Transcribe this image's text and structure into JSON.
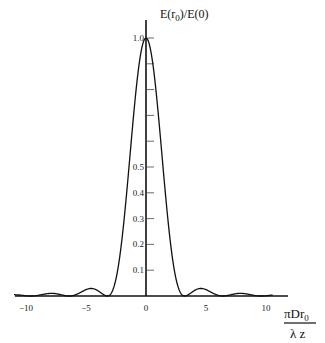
{
  "chart_data": {
    "type": "line",
    "title": "",
    "ylabel": "E(r0)/E(0)",
    "ylabel_parts": {
      "main": "E(r",
      "sub": "0",
      "rest": ")/E(0)"
    },
    "xlabel": "πDr0 / λz",
    "xlabel_parts": {
      "numerator": "πDr",
      "numerator_sub": "0",
      "denominator": "λ z"
    },
    "xlim": [
      -11,
      11.8
    ],
    "ylim": [
      0,
      1.07
    ],
    "grid": false,
    "legend": null,
    "x_ticks": [
      -10,
      -5,
      0,
      5,
      10
    ],
    "x_tick_labels": [
      "−10",
      "−5",
      "0",
      "5",
      "10"
    ],
    "y_ticks": [
      0.1,
      0.2,
      0.3,
      0.4,
      0.5,
      0.6,
      0.7,
      0.8,
      0.9,
      1.0
    ],
    "y_tick_labels": [
      "0.1",
      "0.2",
      "0.3",
      "0.4",
      "0.5",
      "",
      "",
      "",
      "",
      "1.0"
    ],
    "series": [
      {
        "name": "E(r0)/E(0)",
        "x": [
          -11,
          -10.5,
          -9.6,
          -9,
          -8.5,
          -8,
          -7.5,
          -7,
          -6.4,
          -6,
          -5.5,
          -5,
          -4.5,
          -4,
          -3.5,
          -3.2,
          -3,
          -2.5,
          -2,
          -1.5,
          -1,
          -0.5,
          0,
          0.5,
          1,
          1.5,
          2,
          2.5,
          3,
          3.2,
          3.5,
          4,
          4.5,
          5,
          5.5,
          6,
          6.4,
          7,
          7.5,
          8,
          8.5,
          9,
          9.6,
          10,
          10.5
        ],
        "y": [
          0.005,
          0.004,
          0.0,
          0.008,
          0.014,
          0.016,
          0.013,
          0.006,
          0.0,
          0.012,
          0.024,
          0.03,
          0.026,
          0.013,
          0.002,
          0.0,
          0.006,
          0.106,
          0.262,
          0.463,
          0.669,
          0.854,
          1.0,
          0.854,
          0.669,
          0.463,
          0.262,
          0.106,
          0.006,
          0.0,
          0.002,
          0.013,
          0.026,
          0.03,
          0.024,
          0.012,
          0.0,
          0.006,
          0.013,
          0.016,
          0.014,
          0.008,
          0.0,
          0.004,
          0.005
        ]
      }
    ]
  }
}
